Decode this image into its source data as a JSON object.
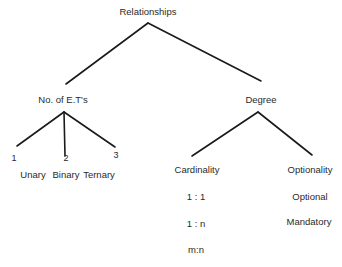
{
  "diagram": {
    "root": {
      "label": "Relationships",
      "x": 148,
      "y": 12
    },
    "branches": [
      {
        "label": "No. of E.T's",
        "x": 63,
        "y": 100,
        "children_numbers": [
          {
            "label": "1",
            "x": 14,
            "y": 158
          },
          {
            "label": "2",
            "x": 66,
            "y": 158
          },
          {
            "label": "3",
            "x": 116,
            "y": 155
          }
        ],
        "children_names": [
          {
            "label": "Unary",
            "x": 33,
            "y": 175
          },
          {
            "label": "Binary",
            "x": 66,
            "y": 175
          },
          {
            "label": "Ternary",
            "x": 99,
            "y": 175
          }
        ]
      },
      {
        "label": "Degree",
        "x": 261,
        "y": 100,
        "children": [
          {
            "label": "Cardinality",
            "x": 197,
            "y": 170,
            "values": [
              {
                "label": "1 : 1",
                "x": 196,
                "y": 197
              },
              {
                "label": "1 : n",
                "x": 196,
                "y": 224
              },
              {
                "label": "m:n",
                "x": 196,
                "y": 250
              }
            ]
          },
          {
            "label": "Optionality",
            "x": 310,
            "y": 170,
            "values": [
              {
                "label": "Optional",
                "x": 310,
                "y": 197
              },
              {
                "label": "Mandatory",
                "x": 309,
                "y": 222
              }
            ]
          }
        ]
      }
    ]
  }
}
